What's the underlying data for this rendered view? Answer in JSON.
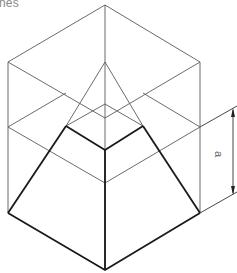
{
  "caption": "nes",
  "dimension": {
    "label": "a"
  },
  "colors": {
    "thin_line": "#5a5a5a",
    "bold_line": "#1a1a1a",
    "caption": "#8a8a8a",
    "background": "#ffffff"
  },
  "figure": {
    "cube_vertices": {
      "top": [
        105,
        5
      ],
      "upper_left": [
        8,
        62
      ],
      "upper_right": [
        200,
        62
      ],
      "upper_center": [
        105,
        118
      ],
      "mid_left": [
        8,
        127
      ],
      "mid_right": [
        200,
        127
      ],
      "mid_center": [
        105,
        183
      ],
      "bottom_left": [
        8,
        213
      ],
      "bottom_right": [
        200,
        213
      ],
      "bottom": [
        105,
        270
      ]
    },
    "apex": [
      105,
      62
    ],
    "frustum_top": {
      "back": [
        105,
        104
      ],
      "left": [
        66,
        126
      ],
      "right": [
        143,
        126
      ],
      "front": [
        105,
        150
      ]
    }
  }
}
